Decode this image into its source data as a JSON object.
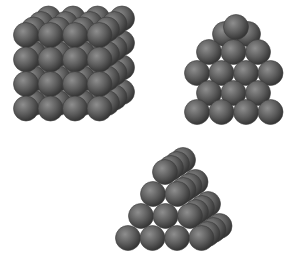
{
  "figure": {
    "sphere_color": "#5a5a5a",
    "sphere_highlight": "#9a9a9a",
    "sphere_shadow": "#2e2e2e",
    "background": "#ffffff"
  },
  "structures": [
    {
      "name": "simple-cubic-stack",
      "front_rows": 4,
      "front_cols": 4,
      "depth_layers": 4
    },
    {
      "name": "hexagonal-close-packed-layer",
      "rows": [
        3,
        4,
        3,
        4
      ],
      "top_partial": 3
    },
    {
      "name": "pyramid-stack",
      "rows": [
        1,
        2,
        3,
        4
      ],
      "depth_layers": 4
    }
  ]
}
